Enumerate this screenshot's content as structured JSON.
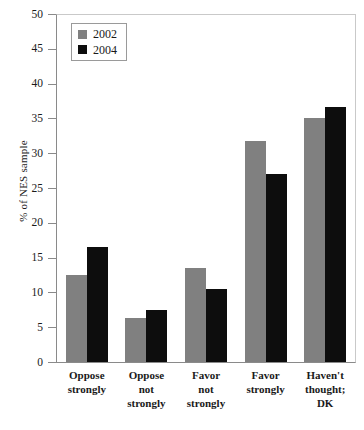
{
  "chart_data": {
    "type": "bar",
    "title": "",
    "subtitle": "",
    "xlabel": "",
    "ylabel": "% of NES sample",
    "ylim": [
      0,
      50
    ],
    "yticks": [
      0,
      5,
      10,
      15,
      20,
      25,
      30,
      35,
      40,
      45,
      50
    ],
    "ytick_labels": [
      "0",
      "5",
      "10",
      "15",
      "20",
      "25",
      "30",
      "35",
      "40",
      "45",
      "50"
    ],
    "grid": false,
    "legend_position": "upper-left-inside",
    "categories": [
      "Oppose strongly",
      "Oppose not strongly",
      "Favor not strongly",
      "Favor strongly",
      "Haven't thought; DK"
    ],
    "category_label_lines": [
      [
        "Oppose",
        "strongly"
      ],
      [
        "Oppose",
        "not",
        "strongly"
      ],
      [
        "Favor",
        "not",
        "strongly"
      ],
      [
        "Favor",
        "strongly"
      ],
      [
        "Haven't",
        "thought;",
        "DK"
      ]
    ],
    "series": [
      {
        "name": "2002",
        "color": "#808080",
        "values": [
          12.5,
          6.3,
          13.5,
          31.7,
          35.0
        ]
      },
      {
        "name": "2004",
        "color": "#0d0d0d",
        "values": [
          16.5,
          7.5,
          10.5,
          27.0,
          36.7
        ]
      }
    ]
  },
  "legend": {
    "items": [
      {
        "label": "2002",
        "color": "#808080"
      },
      {
        "label": "2004",
        "color": "#0d0d0d"
      }
    ]
  }
}
